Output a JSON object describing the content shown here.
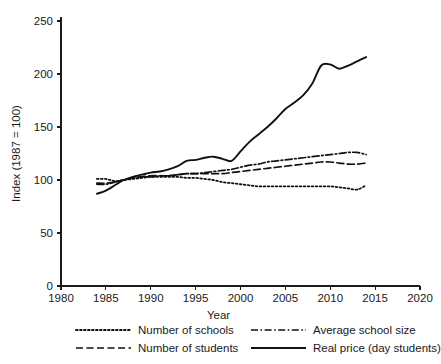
{
  "chart_data": {
    "type": "line",
    "title": "",
    "xlabel": "Year",
    "ylabel": "Index (1987 = 100)",
    "xlim": [
      1980,
      2020
    ],
    "ylim": [
      0,
      250
    ],
    "xticks": [
      1980,
      1985,
      1990,
      1995,
      2000,
      2005,
      2010,
      2015,
      2020
    ],
    "yticks": [
      0,
      50,
      100,
      150,
      200,
      250
    ],
    "grid": false,
    "legend_position": "below-axis",
    "series": [
      {
        "name": "Number of schools",
        "style": "dotted",
        "color": "#111111",
        "x": [
          1984,
          1985,
          1986,
          1987,
          1988,
          1989,
          1990,
          1991,
          1992,
          1993,
          1994,
          1995,
          1996,
          1997,
          1998,
          1999,
          2000,
          2001,
          2002,
          2003,
          2004,
          2005,
          2006,
          2007,
          2008,
          2009,
          2010,
          2011,
          2012,
          2013,
          2014
        ],
        "values": [
          101,
          101,
          99,
          100,
          101,
          102,
          103,
          103,
          103,
          103,
          102,
          102,
          101,
          100,
          98,
          97,
          96,
          95,
          94,
          94,
          94,
          94,
          94,
          94,
          94,
          94,
          94,
          93,
          92,
          91,
          95
        ]
      },
      {
        "name": "Number of students",
        "style": "dashed",
        "color": "#111111",
        "x": [
          1984,
          1985,
          1986,
          1987,
          1988,
          1989,
          1990,
          1991,
          1992,
          1993,
          1994,
          1995,
          1996,
          1997,
          1998,
          1999,
          2000,
          2001,
          2002,
          2003,
          2004,
          2005,
          2006,
          2007,
          2008,
          2009,
          2010,
          2011,
          2012,
          2013,
          2014
        ],
        "values": [
          97,
          97,
          98,
          100,
          102,
          103,
          104,
          104,
          104,
          105,
          106,
          106,
          106,
          106,
          106,
          107,
          108,
          109,
          110,
          111,
          112,
          113,
          114,
          115,
          116,
          117,
          117,
          116,
          115,
          115,
          116
        ]
      },
      {
        "name": "Average school size",
        "style": "dashdot",
        "color": "#111111",
        "x": [
          1984,
          1985,
          1986,
          1987,
          1988,
          1989,
          1990,
          1991,
          1992,
          1993,
          1994,
          1995,
          1996,
          1997,
          1998,
          1999,
          2000,
          2001,
          2002,
          2003,
          2004,
          2005,
          2006,
          2007,
          2008,
          2009,
          2010,
          2011,
          2012,
          2013,
          2014
        ],
        "values": [
          96,
          96,
          98,
          100,
          102,
          103,
          103,
          104,
          104,
          105,
          106,
          106,
          107,
          108,
          109,
          110,
          112,
          114,
          115,
          117,
          118,
          119,
          120,
          121,
          122,
          123,
          124,
          125,
          126,
          126,
          124
        ]
      },
      {
        "name": "Real price (day students)",
        "style": "solid",
        "color": "#111111",
        "x": [
          1984,
          1985,
          1986,
          1987,
          1988,
          1989,
          1990,
          1991,
          1992,
          1993,
          1994,
          1995,
          1996,
          1997,
          1998,
          1999,
          2000,
          2001,
          2002,
          2003,
          2004,
          2005,
          2006,
          2007,
          2008,
          2009,
          2010,
          2011,
          2012,
          2013,
          2014
        ],
        "values": [
          87,
          90,
          95,
          100,
          103,
          105,
          107,
          108,
          110,
          113,
          118,
          119,
          121,
          122,
          120,
          118,
          127,
          136,
          143,
          150,
          158,
          167,
          173,
          180,
          191,
          208,
          209,
          205,
          208,
          212,
          216
        ]
      }
    ]
  },
  "axes": {
    "y_title": "Index (1987 = 100)",
    "x_title": "Year",
    "x_tick_labels": [
      "1980",
      "1985",
      "1990",
      "1995",
      "2000",
      "2005",
      "2010",
      "2015",
      "2020"
    ],
    "y_tick_labels": [
      "0",
      "50",
      "100",
      "150",
      "200",
      "250"
    ]
  },
  "legend": {
    "entries": [
      {
        "label": "Number of schools",
        "style": "dotted"
      },
      {
        "label": "Average school size",
        "style": "dashdot"
      },
      {
        "label": "Number of students",
        "style": "dashed"
      },
      {
        "label": "Real price (day students)",
        "style": "solid"
      }
    ]
  },
  "colors": {
    "ink": "#111111",
    "background": "#ffffff"
  }
}
